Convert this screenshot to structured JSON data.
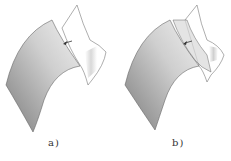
{
  "figure": {
    "panels": [
      {
        "id": "a",
        "caption": "a)"
      },
      {
        "id": "b",
        "caption": "b)"
      }
    ],
    "colors": {
      "surface_dark": "#8a8a8a",
      "surface_light": "#e6e6e6",
      "outline": "#555555",
      "background": "#ffffff"
    }
  }
}
